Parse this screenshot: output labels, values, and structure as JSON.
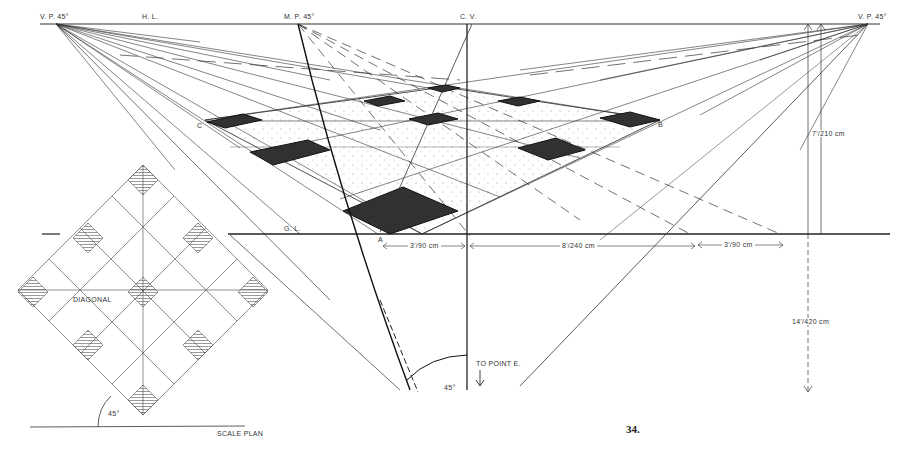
{
  "figure": {
    "page_number": "34.",
    "colors": {
      "ink": "#222222",
      "background": "#ffffff",
      "tile": "#3a3a3a",
      "stipple": "#777777"
    }
  },
  "labels": {
    "vp_left": "V. P. 45°",
    "horizon_line": "H. L.",
    "measuring_point": "M. P. 45°",
    "center_of_vision": "C. V.",
    "vp_right": "V. P. 45°",
    "corner_c": "C",
    "corner_b": "B",
    "corner_a": "A",
    "ground_line": "G. L.",
    "height_dim": "7'/210 cm",
    "dist_dim": "14'/420 cm",
    "dim_1": "3'/90 cm",
    "dim_2": "8'/240 cm",
    "dim_3": "3'/90 cm",
    "to_point_e": "TO POINT E.",
    "angle_main": "45°",
    "diagonal": "DIAGONAL",
    "angle_plan": "45°",
    "scale_plan": "SCALE PLAN"
  }
}
